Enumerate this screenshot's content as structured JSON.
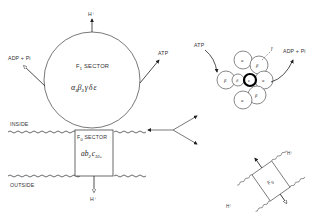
{
  "diagram": {
    "f1": {
      "label": "F",
      "label_sub": "1",
      "label_rest": " SECTOR",
      "composition": "α3β3γδε",
      "composition_parts": [
        "α",
        "3",
        "β",
        "3",
        "γ",
        "δ",
        "ε"
      ]
    },
    "f0": {
      "label": "F",
      "label_sub": "0",
      "label_rest": " SECTOR",
      "composition_parts": [
        "a",
        "b",
        "2",
        "c",
        "10+"
      ]
    },
    "membrane": {
      "inside_label": "INSIDE",
      "outside_label": "OUTSIDE"
    },
    "arrows": {
      "top_proton": "H⁺",
      "bottom_proton": "H⁺",
      "left_reactant": "ADP + Pi",
      "right_product": "ATP"
    },
    "top_view": {
      "left_label": "ATP",
      "right_label": "ADP + Pi",
      "gamma_label": "γ",
      "subunits": [
        {
          "label": "α",
          "pos": "top"
        },
        {
          "label": "β",
          "pos": "top-right"
        },
        {
          "label": "α",
          "pos": "right"
        },
        {
          "label": "β",
          "pos": "bottom-right"
        },
        {
          "label": "α",
          "pos": "bottom"
        },
        {
          "label": "β",
          "pos": "left"
        },
        {
          "label": "δ",
          "pos": "center-left"
        },
        {
          "label": "ε",
          "pos": "center"
        }
      ]
    },
    "tilted_f0": {
      "label": "F",
      "label_sub": "0",
      "top_proton": "H⁺",
      "bottom_proton": "H⁺"
    }
  }
}
